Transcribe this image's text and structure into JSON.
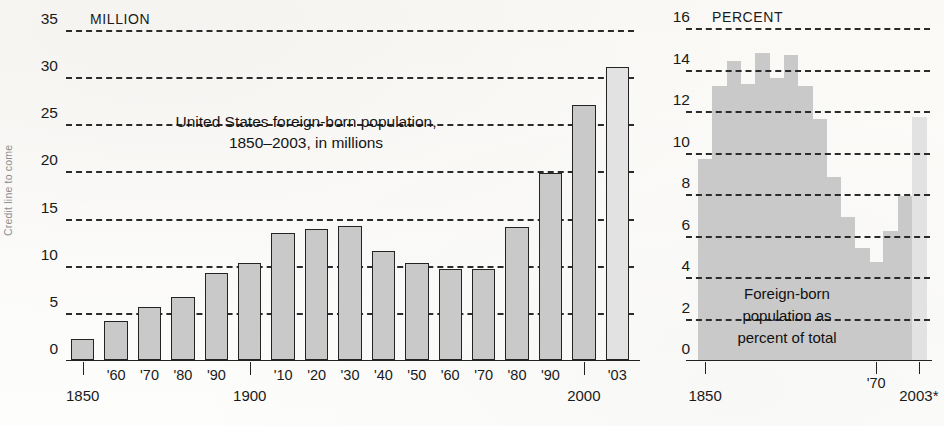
{
  "credit": {
    "text": "Credit line to come"
  },
  "chart_data": [
    {
      "id": "left",
      "type": "bar",
      "title": "United States foreign-born population,\n1850–2003, in millions",
      "unit_label": "MILLION",
      "ylabel": "MILLION",
      "xlabel": "",
      "ylim": [
        0,
        35
      ],
      "yticks": [
        0,
        5,
        10,
        15,
        20,
        25,
        30,
        35
      ],
      "ytick_labels": [
        "0",
        "5",
        "10",
        "15",
        "20",
        "25",
        "30",
        "35"
      ],
      "grid": true,
      "categories": [
        "1850",
        "'60",
        "'70",
        "'80",
        "'90",
        "1900",
        "'10",
        "'20",
        "'30",
        "'40",
        "'50",
        "'60",
        "'70",
        "'80",
        "'90",
        "2000",
        "'03"
      ],
      "axis_major_labels": [
        "1850",
        "1900",
        "2000"
      ],
      "values": [
        2.2,
        4.1,
        5.6,
        6.7,
        9.2,
        10.3,
        13.5,
        13.9,
        14.2,
        11.6,
        10.3,
        9.7,
        9.6,
        14.1,
        19.8,
        27.0,
        31.1
      ],
      "highlight_index": 16
    },
    {
      "id": "right",
      "type": "area",
      "title": "",
      "unit_label": "PERCENT",
      "ylabel": "PERCENT",
      "annotation": "Foreign-born\npopulation as\npercent of total",
      "ylim": [
        0,
        16
      ],
      "yticks": [
        0,
        2,
        4,
        6,
        8,
        10,
        12,
        14,
        16
      ],
      "ytick_labels": [
        "0",
        "2",
        "4",
        "6",
        "8",
        "10",
        "12",
        "14",
        "16"
      ],
      "grid": true,
      "categories": [
        "1850",
        "1860",
        "1870",
        "1880",
        "1890",
        "1900",
        "1910",
        "1920",
        "1930",
        "1940",
        "1950",
        "1960",
        "1970",
        "1980",
        "1990",
        "2003"
      ],
      "axis_labels": [
        "1850",
        "'70",
        "2003*"
      ],
      "values": [
        9.7,
        13.2,
        14.4,
        13.3,
        14.8,
        13.6,
        14.7,
        13.2,
        11.6,
        8.8,
        6.9,
        5.4,
        4.7,
        6.2,
        7.9,
        11.7
      ],
      "highlight_index": 15
    }
  ]
}
